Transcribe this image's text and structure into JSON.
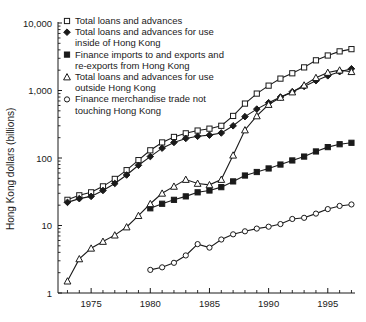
{
  "chart_data": {
    "type": "line",
    "title": "",
    "xlabel": "",
    "ylabel": "Hong Kong dollars (billions)",
    "yscale": "log",
    "ylim": [
      1,
      10000
    ],
    "xlim": [
      1972.2,
      1997.3
    ],
    "ytick_labels": [
      "10,000",
      "1,000",
      "100",
      "10",
      "1"
    ],
    "ytick_values": [
      10000,
      1000,
      100,
      10,
      1
    ],
    "xtick_labels": [
      "1975",
      "1980",
      "1985",
      "1990",
      "1995"
    ],
    "xtick_values": [
      1975,
      1980,
      1985,
      1990,
      1995
    ],
    "grid": false,
    "legend_position": "top-left",
    "series": [
      {
        "name": "Total loans and advances",
        "marker": "open-square",
        "x": [
          1973,
          1974,
          1975,
          1976,
          1977,
          1978,
          1979,
          1980,
          1981,
          1982,
          1983,
          1984,
          1985,
          1986,
          1987,
          1988,
          1989,
          1990,
          1991,
          1992,
          1993,
          1994,
          1995,
          1996,
          1997
        ],
        "y": [
          24,
          28,
          31,
          38,
          49,
          66,
          93,
          130,
          170,
          205,
          232,
          255,
          272,
          300,
          420,
          640,
          900,
          1180,
          1500,
          1800,
          2200,
          2800,
          3300,
          3800,
          4100
        ]
      },
      {
        "name": "Total loans and advances for use inside of Hong Kong",
        "marker": "filled-diamond",
        "x": [
          1973,
          1974,
          1975,
          1976,
          1977,
          1978,
          1979,
          1980,
          1981,
          1982,
          1983,
          1984,
          1985,
          1986,
          1987,
          1988,
          1989,
          1990,
          1991,
          1992,
          1993,
          1994,
          1995,
          1996,
          1997
        ],
        "y": [
          22,
          25,
          27,
          33,
          42,
          56,
          78,
          105,
          140,
          170,
          195,
          210,
          218,
          235,
          300,
          410,
          530,
          660,
          800,
          960,
          1150,
          1400,
          1650,
          1900,
          2100
        ]
      },
      {
        "name": "Finance imports to and exports and re-exports from Hong Kong",
        "marker": "filled-square",
        "x": [
          1980,
          1981,
          1982,
          1983,
          1984,
          1985,
          1986,
          1987,
          1988,
          1989,
          1990,
          1991,
          1992,
          1993,
          1994,
          1995,
          1996,
          1997
        ],
        "y": [
          18,
          21,
          24,
          27,
          31,
          33,
          37,
          45,
          55,
          62,
          70,
          80,
          92,
          105,
          125,
          145,
          160,
          168
        ]
      },
      {
        "name": "Total loans and advances for use outside Hong Kong",
        "marker": "open-triangle",
        "x": [
          1973,
          1974,
          1975,
          1976,
          1977,
          1978,
          1979,
          1980,
          1981,
          1982,
          1983,
          1984,
          1985,
          1986,
          1987,
          1988,
          1989,
          1990,
          1991,
          1992,
          1993,
          1994,
          1995,
          1996,
          1997
        ],
        "y": [
          1.5,
          3.2,
          4.6,
          5.8,
          7.2,
          9.5,
          14,
          21,
          30,
          38,
          48,
          42,
          40,
          48,
          110,
          260,
          420,
          620,
          790,
          950,
          1200,
          1550,
          1850,
          2000,
          1900
        ]
      },
      {
        "name": "Finance merchandise trade not touching Hong Kong",
        "marker": "open-circle",
        "x": [
          1980,
          1981,
          1982,
          1983,
          1984,
          1985,
          1986,
          1987,
          1988,
          1989,
          1990,
          1991,
          1992,
          1993,
          1994,
          1995,
          1996,
          1997
        ],
        "y": [
          2.2,
          2.4,
          2.8,
          3.6,
          5.3,
          4.7,
          6.2,
          7.4,
          8.2,
          9.0,
          9.6,
          10.5,
          12.5,
          13.0,
          15.0,
          17.5,
          19.5,
          20.5
        ]
      }
    ]
  },
  "legend": {
    "items": [
      {
        "marker": "open-square",
        "label": "Total loans and advances"
      },
      {
        "marker": "filled-diamond",
        "label": "Total loans and advances for use",
        "label2": "inside of Hong Kong"
      },
      {
        "marker": "filled-square",
        "label": "Finance imports to and exports and",
        "label2": "re-exports from Hong Kong"
      },
      {
        "marker": "open-triangle",
        "label": "Total loans and advances for use",
        "label2": "outside Hong Kong"
      },
      {
        "marker": "open-circle",
        "label": "Finance merchandise trade not",
        "label2": "touching Hong Kong"
      }
    ]
  },
  "colors": {
    "ink": "#1a1a1a",
    "background": "#ffffff"
  }
}
